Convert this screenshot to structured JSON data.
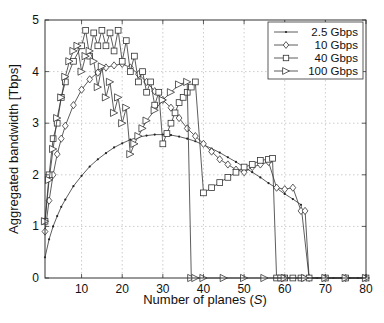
{
  "chart_data": {
    "type": "line",
    "title": "",
    "xlabel": "Number of planes (S)",
    "xlabel_parts": {
      "prefix": "Number of planes (",
      "var": "S",
      "suffix": ")"
    },
    "ylabel": "Aggregated bandwidth [Tbps]",
    "xlim": [
      1,
      80
    ],
    "ylim": [
      0,
      5
    ],
    "xticks": [
      10,
      20,
      30,
      40,
      50,
      60,
      70,
      80
    ],
    "yticks": [
      0,
      1,
      2,
      3,
      4,
      5
    ],
    "grid": true,
    "legend_position": "upper right",
    "series": [
      {
        "name": "2.5 Gbps",
        "marker": "dot",
        "x": [
          1,
          2,
          3,
          4,
          5,
          6,
          8,
          10,
          12,
          14,
          16,
          18,
          20,
          22,
          24,
          26,
          28,
          30,
          32,
          34,
          36,
          38,
          40,
          42,
          44,
          46,
          48,
          50,
          52,
          54,
          56,
          58,
          60,
          62,
          64,
          66,
          68,
          70,
          72,
          74,
          76,
          78,
          80
        ],
        "y": [
          0.4,
          0.75,
          1.0,
          1.2,
          1.38,
          1.52,
          1.78,
          1.98,
          2.16,
          2.3,
          2.42,
          2.53,
          2.61,
          2.68,
          2.73,
          2.76,
          2.78,
          2.78,
          2.77,
          2.74,
          2.7,
          2.65,
          2.58,
          2.51,
          2.43,
          2.34,
          2.25,
          2.15,
          2.05,
          1.95,
          1.84,
          1.74,
          1.63,
          1.53,
          1.42,
          0.0,
          0.0,
          0.0,
          0.0,
          0.0,
          0.0,
          0.0,
          0.0
        ]
      },
      {
        "name": "10 Gbps",
        "marker": "diamond",
        "x": [
          1,
          2,
          3,
          4,
          5,
          6,
          8,
          10,
          12,
          14,
          16,
          18,
          20,
          22,
          24,
          26,
          28,
          30,
          32,
          34,
          36,
          38,
          40,
          42,
          44,
          46,
          48,
          50,
          52,
          54,
          56,
          58,
          60,
          62,
          64,
          65,
          66,
          70,
          75,
          80
        ],
        "y": [
          0.9,
          1.5,
          2.0,
          2.4,
          2.7,
          2.95,
          3.35,
          3.65,
          3.85,
          3.98,
          4.08,
          4.12,
          4.15,
          4.08,
          3.95,
          3.8,
          3.62,
          3.45,
          3.3,
          3.1,
          2.9,
          2.75,
          2.6,
          2.45,
          2.3,
          2.2,
          2.1,
          2.05,
          2.15,
          2.2,
          2.25,
          1.75,
          1.72,
          1.75,
          1.3,
          1.3,
          0.0,
          0.0,
          0.0,
          0.0
        ]
      },
      {
        "name": "40 Gbps",
        "marker": "square",
        "x": [
          1,
          2,
          3,
          4,
          5,
          6,
          8,
          10,
          11,
          12,
          13,
          14,
          15,
          16,
          17,
          18,
          19,
          20,
          21,
          22,
          23,
          24,
          25,
          26,
          27,
          28,
          29,
          30,
          31,
          32,
          33,
          34,
          35,
          36,
          37,
          38,
          40,
          42,
          44,
          46,
          48,
          50,
          52,
          54,
          56,
          57,
          58,
          59,
          60,
          62,
          64,
          66,
          70,
          75,
          80
        ],
        "y": [
          1.1,
          2.0,
          2.7,
          3.0,
          3.5,
          3.8,
          4.2,
          4.5,
          4.8,
          4.3,
          4.75,
          4.5,
          4.8,
          4.5,
          4.75,
          4.4,
          4.8,
          4.2,
          4.6,
          4.0,
          4.3,
          3.8,
          4.0,
          3.6,
          3.8,
          3.35,
          3.6,
          2.6,
          2.8,
          3.0,
          3.2,
          3.4,
          3.5,
          3.6,
          3.7,
          3.8,
          1.65,
          1.75,
          1.85,
          1.95,
          2.05,
          2.15,
          2.2,
          2.28,
          2.3,
          2.32,
          0.0,
          0.0,
          0.0,
          0.0,
          0.0,
          0.0,
          0.0,
          0.0,
          0.0
        ]
      },
      {
        "name": "100 Gbps",
        "marker": "triangle-right",
        "x": [
          1,
          2,
          3,
          4,
          5,
          6,
          7,
          8,
          9,
          10,
          11,
          12,
          13,
          14,
          15,
          16,
          17,
          18,
          19,
          20,
          21,
          22,
          23,
          24,
          25,
          26,
          28,
          30,
          32,
          34,
          36,
          37,
          38,
          40,
          45,
          50,
          55,
          60,
          65,
          70,
          75,
          80
        ],
        "y": [
          1.1,
          1.9,
          2.5,
          3.1,
          3.5,
          3.9,
          4.2,
          4.4,
          4.5,
          4.0,
          4.3,
          4.4,
          4.2,
          3.7,
          4.1,
          3.5,
          3.8,
          3.2,
          3.5,
          3.0,
          3.3,
          2.4,
          2.6,
          2.75,
          2.9,
          3.05,
          3.25,
          3.45,
          3.6,
          3.75,
          3.8,
          0.0,
          0.0,
          0.0,
          0.0,
          0.0,
          0.0,
          0.0,
          0.0,
          0.0,
          0.0,
          0.0
        ]
      }
    ]
  },
  "legend": {
    "items": [
      {
        "label": "2.5 Gbps",
        "marker": "dot"
      },
      {
        "label": "10 Gbps",
        "marker": "diamond"
      },
      {
        "label": "40 Gbps",
        "marker": "square"
      },
      {
        "label": "100 Gbps",
        "marker": "triangle-right"
      }
    ]
  },
  "axes": {
    "x_tick_labels": [
      "10",
      "20",
      "30",
      "40",
      "50",
      "60",
      "70",
      "80"
    ],
    "y_tick_labels": [
      "0",
      "1",
      "2",
      "3",
      "4",
      "5"
    ]
  }
}
